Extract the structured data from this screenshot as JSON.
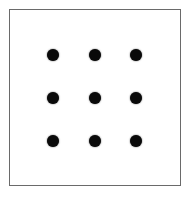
{
  "diagram": {
    "type": "nine-dot-grid",
    "frame": {
      "border_color": "#6a6a6a"
    },
    "dot_color": "#0a0a0a",
    "rows": 3,
    "cols": 3,
    "dots": [
      {
        "row": 0,
        "col": 0,
        "x": 53,
        "y": 55
      },
      {
        "row": 0,
        "col": 1,
        "x": 95,
        "y": 55
      },
      {
        "row": 0,
        "col": 2,
        "x": 136,
        "y": 55
      },
      {
        "row": 1,
        "col": 0,
        "x": 53,
        "y": 98
      },
      {
        "row": 1,
        "col": 1,
        "x": 95,
        "y": 98
      },
      {
        "row": 1,
        "col": 2,
        "x": 136,
        "y": 98
      },
      {
        "row": 2,
        "col": 0,
        "x": 53,
        "y": 141
      },
      {
        "row": 2,
        "col": 1,
        "x": 95,
        "y": 141
      },
      {
        "row": 2,
        "col": 2,
        "x": 136,
        "y": 141
      }
    ]
  }
}
